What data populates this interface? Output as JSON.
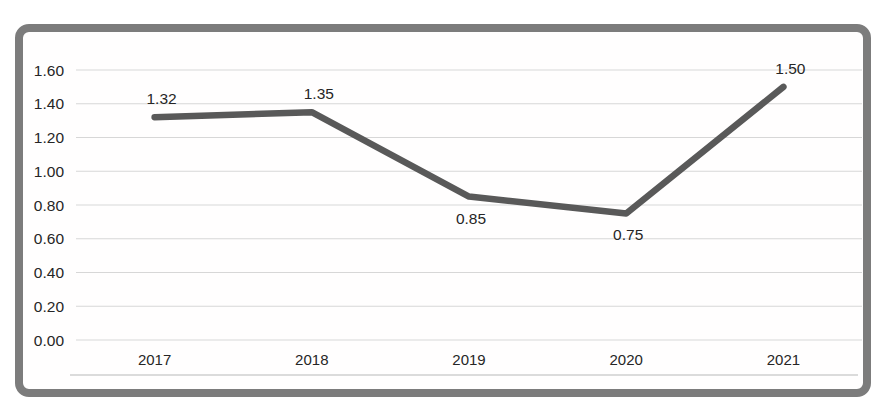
{
  "chart_data": {
    "type": "line",
    "title": "",
    "xlabel": "",
    "ylabel": "",
    "categories": [
      "2017",
      "2018",
      "2019",
      "2020",
      "2021"
    ],
    "series": [
      {
        "name": "",
        "values": [
          1.32,
          1.35,
          0.85,
          0.75,
          1.5
        ]
      }
    ],
    "data_labels": [
      "1.32",
      "1.35",
      "0.85",
      "0.75",
      "1.50"
    ],
    "data_label_positions": [
      "above",
      "above",
      "below",
      "below",
      "above"
    ],
    "ylim": [
      0.0,
      1.6
    ],
    "y_tick_step": 0.2,
    "y_tick_labels": [
      "0.00",
      "0.20",
      "0.40",
      "0.60",
      "0.80",
      "1.00",
      "1.20",
      "1.40",
      "1.60"
    ],
    "grid": "horizontal",
    "legend": "none"
  },
  "style": {
    "frame_border_color": "#7c7c7c",
    "line_color": "#595959",
    "gridline_color": "#d7d7d7",
    "axis_line_color": "#cfcfcf",
    "label_color": "#262626",
    "plot_background": "#fffefe"
  }
}
